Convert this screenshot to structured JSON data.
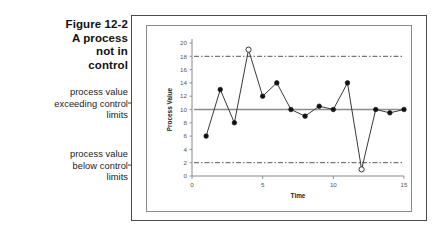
{
  "figure": {
    "title_lines": [
      "Figure 12-2",
      "A process",
      "not in",
      "control"
    ]
  },
  "annotations": [
    {
      "id": "upper",
      "lines": [
        "process value",
        "exceeding control",
        "limits"
      ]
    },
    {
      "id": "lower",
      "lines": [
        "process value",
        "below control",
        "limits"
      ]
    }
  ],
  "chart_data": {
    "type": "line",
    "title": "",
    "xlabel": "Time",
    "ylabel": "Process Value",
    "x": [
      1,
      2,
      3,
      4,
      5,
      6,
      7,
      8,
      9,
      10,
      11,
      12,
      13,
      14,
      15
    ],
    "values": [
      6,
      13,
      8,
      19,
      12,
      14,
      10,
      9,
      10.5,
      10,
      14,
      1,
      10,
      9.5,
      10
    ],
    "out_of_control_points": [
      {
        "x": 4,
        "y": 19,
        "reason": "above upper control limit"
      },
      {
        "x": 12,
        "y": 1,
        "reason": "below lower control limit"
      }
    ],
    "center_line": 10,
    "upper_control_limit": 18,
    "lower_control_limit": 2,
    "xlim": [
      0,
      15
    ],
    "ylim": [
      0,
      20
    ],
    "yticks": [
      0,
      2,
      4,
      6,
      8,
      10,
      12,
      14,
      16,
      18,
      20
    ],
    "xticks": [
      0,
      5,
      10,
      15
    ],
    "grid": false,
    "legend": "none",
    "marker_style": "filled-circle",
    "outlier_marker_style": "open-circle",
    "colors": {
      "series_line": "#3a3a3a",
      "marker_fill": "#111111",
      "center_line": "#8c8c8c",
      "control_limit_line": "#444444",
      "axis": "#888888",
      "tick_text": "#555555"
    }
  }
}
